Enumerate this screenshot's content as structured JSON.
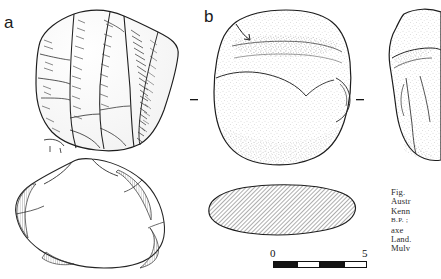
{
  "figure": {
    "type": "archaeological-artifact-plate",
    "panel_labels": {
      "a": "a",
      "b": "b"
    },
    "specimens": [
      {
        "id": "a",
        "label": "a",
        "view": "flaked core, lateral view with plan/section below",
        "rendering": "line drawing with flake-scar hachure"
      },
      {
        "id": "b",
        "label": "b",
        "view": "ground-edge axe, face view with hatched cross-section below",
        "rendering": "stippled line drawing"
      },
      {
        "id": "c",
        "label": "",
        "view": "side view of axe, cropped at right page margin",
        "rendering": "stippled line drawing"
      }
    ],
    "scale_bar": {
      "min_label": "0",
      "max_label": "5",
      "segments": 4,
      "units_implied": "cm"
    },
    "caption": {
      "truncated": true,
      "lines": [
        "Fig.",
        "Austr",
        "Kenn",
        "B.P. ;",
        "axe",
        "Land.",
        "Mulv"
      ],
      "smallcaps_line_index": 3
    }
  },
  "colors": {
    "ink": "#1a1a1a",
    "paper": "#ffffff",
    "caption_ink": "#2b2b2b",
    "hatch": "#555555"
  }
}
